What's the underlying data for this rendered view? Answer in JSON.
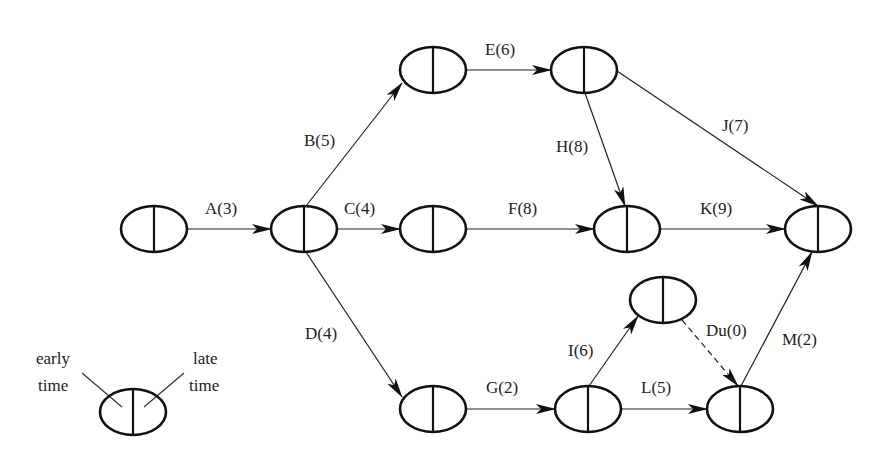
{
  "diagram": {
    "type": "activity-on-arrow network",
    "nodes": [
      {
        "id": "n1",
        "x": 154,
        "y": 229
      },
      {
        "id": "n2",
        "x": 304,
        "y": 229
      },
      {
        "id": "n3",
        "x": 433,
        "y": 70
      },
      {
        "id": "n4",
        "x": 584,
        "y": 70
      },
      {
        "id": "n5",
        "x": 433,
        "y": 229
      },
      {
        "id": "n6",
        "x": 627,
        "y": 229
      },
      {
        "id": "n7",
        "x": 818,
        "y": 229
      },
      {
        "id": "n8",
        "x": 433,
        "y": 409
      },
      {
        "id": "n9",
        "x": 588,
        "y": 409
      },
      {
        "id": "n10",
        "x": 663,
        "y": 300
      },
      {
        "id": "n11",
        "x": 740,
        "y": 409
      }
    ],
    "activities": [
      {
        "id": "A",
        "label": "A(3)",
        "from": "n1",
        "to": "n2",
        "duration": 3,
        "dashed": false
      },
      {
        "id": "B",
        "label": "B(5)",
        "from": "n2",
        "to": "n3",
        "duration": 5,
        "dashed": false
      },
      {
        "id": "C",
        "label": "C(4)",
        "from": "n2",
        "to": "n5",
        "duration": 4,
        "dashed": false
      },
      {
        "id": "D",
        "label": "D(4)",
        "from": "n2",
        "to": "n8",
        "duration": 4,
        "dashed": false
      },
      {
        "id": "E",
        "label": "E(6)",
        "from": "n3",
        "to": "n4",
        "duration": 6,
        "dashed": false
      },
      {
        "id": "F",
        "label": "F(8)",
        "from": "n5",
        "to": "n6",
        "duration": 8,
        "dashed": false
      },
      {
        "id": "G",
        "label": "G(2)",
        "from": "n8",
        "to": "n9",
        "duration": 2,
        "dashed": false
      },
      {
        "id": "H",
        "label": "H(8)",
        "from": "n4",
        "to": "n6",
        "duration": 8,
        "dashed": false
      },
      {
        "id": "I",
        "label": "I(6)",
        "from": "n9",
        "to": "n10",
        "duration": 6,
        "dashed": false
      },
      {
        "id": "J",
        "label": "J(7)",
        "from": "n4",
        "to": "n7",
        "duration": 7,
        "dashed": false
      },
      {
        "id": "K",
        "label": "K(9)",
        "from": "n6",
        "to": "n7",
        "duration": 9,
        "dashed": false
      },
      {
        "id": "L",
        "label": "L(5)",
        "from": "n9",
        "to": "n11",
        "duration": 5,
        "dashed": false
      },
      {
        "id": "M",
        "label": "M(2)",
        "from": "n11",
        "to": "n7",
        "duration": 2,
        "dashed": false
      },
      {
        "id": "Du",
        "label": "Du(0)",
        "from": "n10",
        "to": "n11",
        "duration": 0,
        "dashed": true
      }
    ],
    "legend": {
      "left_line1": "early",
      "left_line2": "time",
      "right_line1": "late",
      "right_line2": "time"
    }
  },
  "labels": {
    "A": "A(3)",
    "B": "B(5)",
    "C": "C(4)",
    "D": "D(4)",
    "E": "E(6)",
    "F": "F(8)",
    "G": "G(2)",
    "H": "H(8)",
    "I": "I(6)",
    "J": "J(7)",
    "K": "K(9)",
    "L": "L(5)",
    "M": "M(2)",
    "Du": "Du(0)"
  }
}
